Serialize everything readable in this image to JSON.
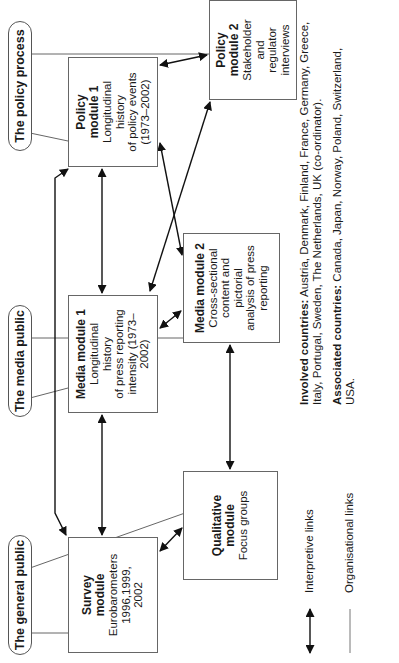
{
  "headers": {
    "general_public": "The general public",
    "media_public": "The media public",
    "policy_process": "The policy process"
  },
  "modules": {
    "survey": {
      "title": "Survey module",
      "title_line1": "Survey",
      "title_line2": "module",
      "desc": [
        "Eurobarometers",
        "1996,1999,",
        "2002"
      ]
    },
    "qualitative": {
      "title_line1": "Qualitative",
      "title_line2": "module",
      "desc": [
        "Focus groups"
      ]
    },
    "media1": {
      "title_line1": "Media module 1",
      "desc": [
        "Longitudinal",
        "history",
        "of press reporting",
        "intensity (1973–",
        "2002)"
      ]
    },
    "media2": {
      "title_line1": "Media module 2",
      "desc": [
        "Cross-sectional",
        "content and",
        "pictorial",
        "analysis of press",
        "reporting"
      ]
    },
    "policy1": {
      "title_line1": "Policy",
      "title_line2": "module 1",
      "desc": [
        "Longitudinal",
        "history",
        "of policy events",
        "(1973–2002)"
      ]
    },
    "policy2": {
      "title_line1": "Policy",
      "title_line2": "module 2",
      "desc": [
        "Stakeholder",
        "and",
        "regulator",
        "interviews"
      ]
    }
  },
  "legend": {
    "interpretive": {
      "icon": "double-arrow-icon",
      "label": "Interpretive links"
    },
    "organisational": {
      "icon": "thin-line-icon",
      "label": "Organisational links"
    }
  },
  "notes": {
    "involved_label": "Involved countries:",
    "involved_text": "Austria, Denmark, Finland, France, Germany, Greece, Italy, Portugal, Sweden, The Netherlands, UK (co-ordinator).",
    "associated_label": "Associated countries:",
    "associated_text": "Canada, Japan, Norway, Poland, Switzerland, USA."
  },
  "colors": {
    "line": "#1a1a1a",
    "org_line": "#555555",
    "box_border": "#666666"
  }
}
